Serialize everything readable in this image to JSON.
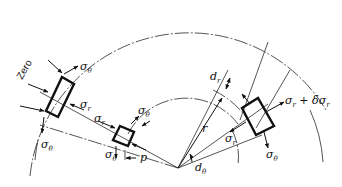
{
  "diagram": {
    "labels": {
      "zero": "Zero",
      "sigma": "σ",
      "theta_sub": "θ",
      "r_sub": "r",
      "sigma_r_plus": "σ",
      "plus_delta": "+ δσ",
      "p": "p",
      "r": "r",
      "d": "d",
      "dr_sub": "r",
      "dtheta_sub": "θ"
    },
    "elements": [
      {
        "name": "outer-surface-element",
        "stresses": [
          "σθ",
          "σr",
          "σθ",
          "Zero"
        ]
      },
      {
        "name": "inner-surface-element",
        "stresses": [
          "σθ",
          "σr",
          "σθ",
          "p"
        ]
      },
      {
        "name": "general-element",
        "stresses": [
          "σr + δσr",
          "σr",
          "σθ",
          "σθ",
          "dr",
          "dθ",
          "r"
        ]
      }
    ],
    "colors": {
      "line": "#111111",
      "background": "#ffffff"
    }
  }
}
